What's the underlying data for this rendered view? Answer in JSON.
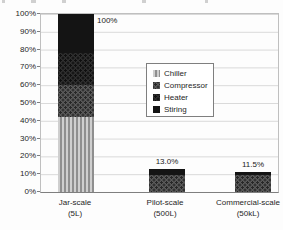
{
  "chart_data": {
    "type": "bar",
    "stacked": true,
    "title": "",
    "xlabel": "",
    "ylabel": "",
    "ylim": [
      0,
      100
    ],
    "ytick_step": 10,
    "ytick_labels": [
      "100%",
      "90%",
      "80%",
      "70%",
      "60%",
      "50%",
      "40%",
      "30%",
      "20%",
      "10%",
      "0%"
    ],
    "grid": true,
    "categories": [
      {
        "label": "Jar-scale",
        "sublabel": "(5L)"
      },
      {
        "label": "Pilot-scale",
        "sublabel": "(500L)"
      },
      {
        "label": "Commercial-scale",
        "sublabel": "(50kL)"
      }
    ],
    "series": [
      {
        "name": "Chiller",
        "pattern": "light-vertical-stripes",
        "values": [
          42.2,
          0.0,
          0.0
        ]
      },
      {
        "name": "Compressor",
        "pattern": "gray-dotted",
        "values": [
          17.8,
          9.5,
          9.5
        ]
      },
      {
        "name": "Heater",
        "pattern": "dark-dotted",
        "values": [
          18.3,
          0.0,
          0.0
        ]
      },
      {
        "name": "Stiring",
        "pattern": "black-solid",
        "values": [
          21.7,
          3.5,
          2.0
        ]
      }
    ],
    "bar_totals": [
      100.0,
      13.0,
      11.5
    ],
    "total_labels": [
      "100%",
      "13.0%",
      "11.5%"
    ],
    "legend": {
      "position": "center-right-of-plot",
      "entries": [
        "Chiller",
        "Compressor",
        "Heater",
        "Stiring"
      ]
    }
  },
  "colors": {
    "stiring": "#141414",
    "heater_base": "#2f2f2f",
    "heater_dot": "#0f0f0f",
    "compressor_base": "#5a5a5a",
    "compressor_dot": "#262626",
    "chiller_light": "#cfcfcf",
    "chiller_dark": "#8f8f8f",
    "gridline": "#d9d9d9",
    "axis": "#7f7f7f",
    "text": "#262626"
  }
}
